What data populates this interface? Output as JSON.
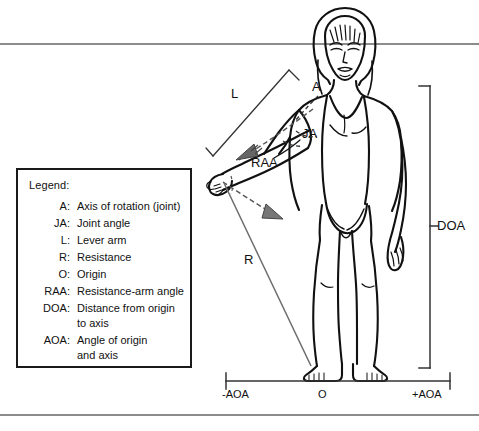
{
  "figure": {
    "legend": {
      "title": "Legend:",
      "entries": [
        {
          "abbr": "A:",
          "desc": "Axis of rotation (joint)",
          "desc_line2": ""
        },
        {
          "abbr": "JA:",
          "desc": "Joint angle",
          "desc_line2": ""
        },
        {
          "abbr": "L:",
          "desc": "Lever arm",
          "desc_line2": ""
        },
        {
          "abbr": "R:",
          "desc": "Resistance",
          "desc_line2": ""
        },
        {
          "abbr": "O:",
          "desc": "Origin",
          "desc_line2": ""
        },
        {
          "abbr": "RAA:",
          "desc": "Resistance-arm angle",
          "desc_line2": ""
        },
        {
          "abbr": "DOA:",
          "desc": "Distance from origin",
          "desc_line2": "to axis"
        },
        {
          "abbr": "AOA:",
          "desc": "Angle of origin",
          "desc_line2": "and axis"
        }
      ]
    },
    "annotations": {
      "lever_arm": "L",
      "axis": "A",
      "joint_angle": "JA",
      "resistance_arm_angle": "RAA",
      "resistance": "R",
      "distance_origin_axis": "DOA",
      "axis_negative": "-AOA",
      "origin": "O",
      "axis_positive": "+AOA"
    },
    "colors": {
      "ink": "#111111",
      "rule": "#8c8c8c",
      "background": "#ffffff",
      "leader": "#555555"
    }
  }
}
